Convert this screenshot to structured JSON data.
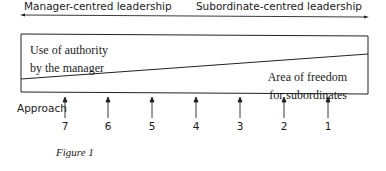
{
  "diagram": {
    "axis": {
      "left_label": "Manager-centred leadership",
      "right_label": "Subordinate-centred leadership"
    },
    "box": {
      "upper_region": [
        "Use of authority",
        "by the manager"
      ],
      "lower_region": [
        "Area of freedom",
        "for subordinates"
      ]
    },
    "approach_label": "Approach",
    "approaches": [
      "7",
      "6",
      "5",
      "4",
      "3",
      "2",
      "1"
    ],
    "caption": "Figure 1"
  }
}
